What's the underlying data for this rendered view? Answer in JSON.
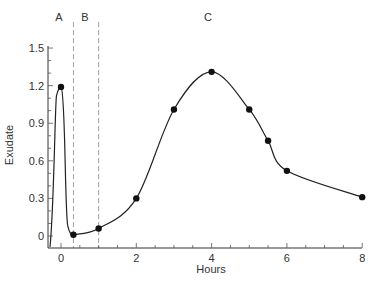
{
  "chart_data": {
    "type": "line",
    "title": "",
    "xlabel": "Hours",
    "ylabel": "Exudate",
    "xlim": [
      -0.35,
      8
    ],
    "ylim": [
      -0.1,
      1.5
    ],
    "x_ticks": [
      0,
      2,
      4,
      6,
      8
    ],
    "x_tick_labels": [
      "0",
      "2",
      "4",
      "6",
      "8"
    ],
    "y_ticks": [
      0,
      0.3,
      0.6,
      0.9,
      1.2,
      1.5
    ],
    "y_tick_labels": [
      "0",
      "0.3",
      "0.6",
      "0.9",
      "1.2",
      "1.5"
    ],
    "grid": false,
    "legend": null,
    "regions": [
      {
        "label": "A",
        "x_start": -0.35,
        "x_end": 0.33
      },
      {
        "label": "B",
        "x_start": 0.33,
        "x_end": 1.0
      },
      {
        "label": "C",
        "x_start": 1.0,
        "x_end": 8
      }
    ],
    "region_dividers": [
      0.33,
      1.0
    ],
    "series": [
      {
        "name": "Exudate",
        "x": [
          0,
          0.33,
          1,
          2,
          3,
          4,
          5,
          5.5,
          6,
          8
        ],
        "values": [
          1.19,
          0.01,
          0.06,
          0.3,
          1.01,
          1.31,
          1.01,
          0.76,
          0.52,
          0.31
        ]
      }
    ]
  },
  "labels": {
    "xlabel": "Hours",
    "ylabel": "Exudate",
    "region_a": "A",
    "region_b": "B",
    "region_c": "C"
  }
}
